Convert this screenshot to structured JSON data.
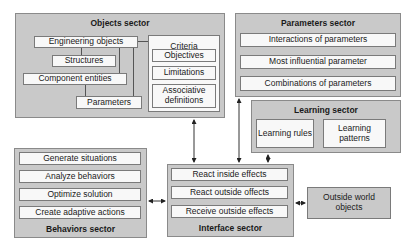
{
  "objects_sector": {
    "title": "Objects sector",
    "items": [
      "Engineering objects",
      "Structures",
      "Component entities",
      "Parameters"
    ],
    "criteria": {
      "title": "Criteria",
      "items": [
        "Objectives",
        "Limitations",
        "Associative definitions"
      ]
    }
  },
  "parameters_sector": {
    "title": "Parameters sector",
    "items": [
      "Interactions of parameters",
      "Most influential parameter",
      "Combinations of parameters"
    ]
  },
  "learning_sector": {
    "title": "Learning sector",
    "items": [
      "Learning rules",
      "Learning patterns"
    ]
  },
  "behaviors_sector": {
    "title": "Behaviors sector",
    "items": [
      "Generate situations",
      "Analyze behaviors",
      "Optimize solution",
      "Create adaptive actions"
    ]
  },
  "interface_sector": {
    "title": "Interface sector",
    "items": [
      "React inside effects",
      "React outside offects",
      "Receive outside effects"
    ]
  },
  "outside_world": {
    "label": "Outside world objects"
  },
  "colors": {
    "sector_fill": "#c9c9c9",
    "box_fill": "#f8f8f8",
    "border": "#7a7a7a"
  }
}
